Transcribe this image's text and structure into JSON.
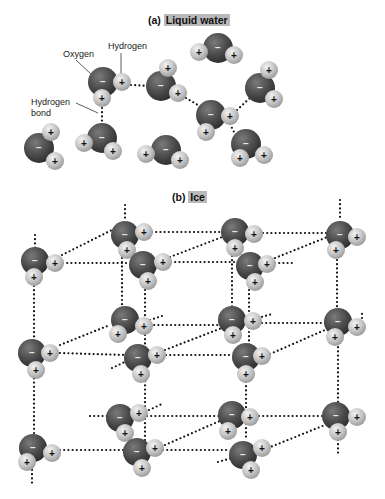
{
  "panels": [
    {
      "prefix": "(a)",
      "title": "Liquid water"
    },
    {
      "prefix": "(b)",
      "title": "Ice"
    }
  ],
  "labels": {
    "oxygen": "Oxygen",
    "hydrogen": "Hydrogen",
    "hbond_line1": "Hydrogen",
    "hbond_line2": "bond"
  },
  "charges": {
    "oxygen": "−",
    "hydrogen": "+"
  },
  "colors": {
    "oxygen": "#4a4a4a",
    "hydrogen": "#c4c4c4",
    "bond_dots": "#111111",
    "title_highlight": "#b9b9b9"
  },
  "liquid_molecules": [
    {
      "o": [
        103,
        82
      ],
      "h": [
        [
          122,
          82
        ],
        [
          102,
          98
        ]
      ]
    },
    {
      "o": [
        161,
        86
      ],
      "h": [
        [
          168,
          68
        ],
        [
          178,
          93
        ]
      ]
    },
    {
      "o": [
        218,
        48
      ],
      "h": [
        [
          199,
          52
        ],
        [
          234,
          55
        ]
      ]
    },
    {
      "o": [
        211,
        115
      ],
      "h": [
        [
          230,
          116
        ],
        [
          206,
          132
        ]
      ]
    },
    {
      "o": [
        260,
        88
      ],
      "h": [
        [
          269,
          70
        ],
        [
          274,
          99
        ]
      ]
    },
    {
      "o": [
        246,
        144
      ],
      "h": [
        [
          240,
          158
        ],
        [
          264,
          155
        ]
      ]
    },
    {
      "o": [
        39,
        148
      ],
      "h": [
        [
          51,
          132
        ],
        [
          55,
          161
        ]
      ]
    },
    {
      "o": [
        102,
        138
      ],
      "h": [
        [
          84,
          143
        ],
        [
          113,
          151
        ]
      ]
    },
    {
      "o": [
        166,
        150
      ],
      "h": [
        [
          146,
          154
        ],
        [
          180,
          160
        ]
      ]
    }
  ],
  "liquid_bonds": [
    [
      [
        131,
        85
      ],
      [
        150,
        86
      ]
    ],
    [
      [
        102,
        108
      ],
      [
        102,
        126
      ]
    ],
    [
      [
        186,
        98
      ],
      [
        203,
        108
      ]
    ],
    [
      [
        237,
        110
      ],
      [
        250,
        98
      ]
    ],
    [
      [
        230,
        124
      ],
      [
        236,
        136
      ]
    ]
  ],
  "ice_molecules": [
    {
      "o": [
        125,
        235
      ],
      "h": [
        [
          144,
          232
        ],
        [
          127,
          250
        ]
      ]
    },
    {
      "o": [
        235,
        232
      ],
      "h": [
        [
          254,
          234
        ],
        [
          235,
          248
        ]
      ]
    },
    {
      "o": [
        340,
        235
      ],
      "h": [
        [
          357,
          237
        ],
        [
          336,
          250
        ]
      ]
    },
    {
      "o": [
        35,
        261
      ],
      "h": [
        [
          55,
          263
        ],
        [
          34,
          277
        ]
      ]
    },
    {
      "o": [
        143,
        265
      ],
      "h": [
        [
          163,
          262
        ],
        [
          148,
          281
        ]
      ]
    },
    {
      "o": [
        250,
        266
      ],
      "h": [
        [
          267,
          264
        ],
        [
          255,
          282
        ]
      ]
    },
    {
      "o": [
        125,
        320
      ],
      "h": [
        [
          144,
          326
        ],
        [
          118,
          334
        ]
      ]
    },
    {
      "o": [
        232,
        320
      ],
      "h": [
        [
          253,
          321
        ],
        [
          233,
          335
        ]
      ]
    },
    {
      "o": [
        338,
        322
      ],
      "h": [
        [
          357,
          327
        ],
        [
          335,
          337
        ]
      ]
    },
    {
      "o": [
        32,
        353
      ],
      "h": [
        [
          50,
          353
        ],
        [
          36,
          370
        ]
      ]
    },
    {
      "o": [
        138,
        358
      ],
      "h": [
        [
          157,
          355
        ],
        [
          141,
          374
        ]
      ]
    },
    {
      "o": [
        246,
        357
      ],
      "h": [
        [
          262,
          356
        ],
        [
          246,
          374
        ]
      ]
    },
    {
      "o": [
        120,
        418
      ],
      "h": [
        [
          139,
          413
        ],
        [
          125,
          433
        ]
      ]
    },
    {
      "o": [
        232,
        415
      ],
      "h": [
        [
          250,
          417
        ],
        [
          228,
          431
        ]
      ]
    },
    {
      "o": [
        336,
        416
      ],
      "h": [
        [
          357,
          417
        ],
        [
          338,
          432
        ]
      ]
    },
    {
      "o": [
        33,
        448
      ],
      "h": [
        [
          52,
          453
        ],
        [
          27,
          462
        ]
      ]
    },
    {
      "o": [
        137,
        452
      ],
      "h": [
        [
          155,
          448
        ],
        [
          142,
          468
        ]
      ]
    },
    {
      "o": [
        243,
        455
      ],
      "h": [
        [
          262,
          448
        ],
        [
          251,
          470
        ]
      ]
    }
  ],
  "ice_bonds": [
    [
      [
        125,
        205
      ],
      [
        125,
        220
      ]
    ],
    [
      [
        340,
        200
      ],
      [
        340,
        220
      ]
    ],
    [
      [
        35,
        235
      ],
      [
        35,
        249
      ]
    ],
    [
      [
        152,
        232
      ],
      [
        222,
        232
      ]
    ],
    [
      [
        263,
        233
      ],
      [
        326,
        233
      ]
    ],
    [
      [
        63,
        263
      ],
      [
        130,
        263
      ]
    ],
    [
      [
        171,
        262
      ],
      [
        238,
        262
      ]
    ],
    [
      [
        275,
        263
      ],
      [
        293,
        263
      ]
    ],
    [
      [
        62,
        255
      ],
      [
        112,
        230
      ]
    ],
    [
      [
        170,
        257
      ],
      [
        225,
        236
      ]
    ],
    [
      [
        275,
        258
      ],
      [
        330,
        236
      ]
    ],
    [
      [
        34,
        286
      ],
      [
        34,
        440
      ]
    ],
    [
      [
        122,
        258
      ],
      [
        122,
        312
      ]
    ],
    [
      [
        145,
        290
      ],
      [
        145,
        325
      ]
    ],
    [
      [
        232,
        256
      ],
      [
        232,
        311
      ]
    ],
    [
      [
        249,
        290
      ],
      [
        249,
        345
      ]
    ],
    [
      [
        337,
        260
      ],
      [
        337,
        310
      ]
    ],
    [
      [
        150,
        325
      ],
      [
        222,
        325
      ]
    ],
    [
      [
        262,
        323
      ],
      [
        325,
        323
      ]
    ],
    [
      [
        150,
        320
      ],
      [
        162,
        316
      ]
    ],
    [
      [
        258,
        318
      ],
      [
        272,
        314
      ]
    ],
    [
      [
        362,
        318
      ],
      [
        362,
        310
      ]
    ],
    [
      [
        60,
        353
      ],
      [
        125,
        355
      ]
    ],
    [
      [
        166,
        355
      ],
      [
        233,
        355
      ]
    ],
    [
      [
        270,
        354
      ],
      [
        325,
        330
      ]
    ],
    [
      [
        60,
        345
      ],
      [
        110,
        325
      ]
    ],
    [
      [
        165,
        350
      ],
      [
        222,
        328
      ]
    ],
    [
      [
        112,
        368
      ],
      [
        125,
        362
      ]
    ],
    [
      [
        90,
        416
      ],
      [
        108,
        416
      ]
    ],
    [
      [
        147,
        416
      ],
      [
        222,
        416
      ]
    ],
    [
      [
        259,
        416
      ],
      [
        324,
        416
      ]
    ],
    [
      [
        145,
        335
      ],
      [
        145,
        440
      ]
    ],
    [
      [
        246,
        382
      ],
      [
        246,
        440
      ]
    ],
    [
      [
        338,
        343
      ],
      [
        338,
        405
      ]
    ],
    [
      [
        338,
        440
      ],
      [
        338,
        455
      ]
    ],
    [
      [
        149,
        410
      ],
      [
        162,
        404
      ]
    ],
    [
      [
        60,
        450
      ],
      [
        125,
        450
      ]
    ],
    [
      [
        163,
        450
      ],
      [
        230,
        450
      ]
    ],
    [
      [
        165,
        445
      ],
      [
        222,
        420
      ]
    ],
    [
      [
        268,
        448
      ],
      [
        325,
        425
      ]
    ],
    [
      [
        32,
        470
      ],
      [
        32,
        485
      ]
    ],
    [
      [
        218,
        462
      ],
      [
        232,
        458
      ]
    ]
  ]
}
